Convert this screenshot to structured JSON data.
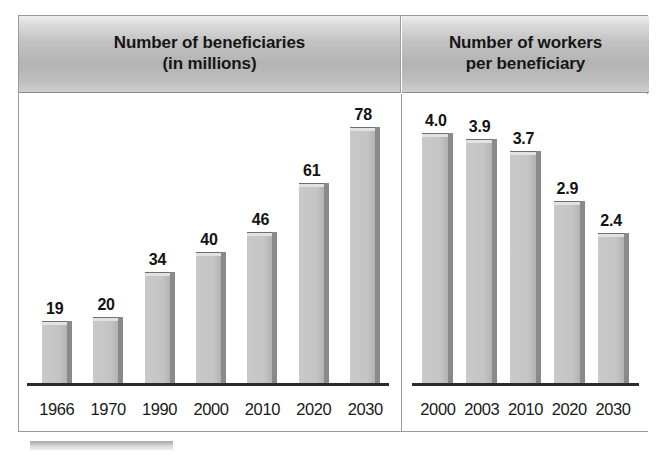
{
  "figure": {
    "panels": [
      {
        "id": "beneficiaries",
        "title": "Number of beneficiaries\n(in millions)"
      },
      {
        "id": "workers-per-beneficiary",
        "title": "Number of workers\nper beneficiary"
      }
    ]
  },
  "colors": {
    "bar_face": "#c4c4c4",
    "bar_top_cap": "#e2e2e2",
    "bar_shadow": "#8a8a8a",
    "header_band": "#b4b4b4",
    "axis": "#2b2b2b",
    "frame_border": "#9a9a9a",
    "text": "#161616",
    "background": "#ffffff"
  },
  "chart_data": [
    {
      "type": "bar",
      "title": "Number of beneficiaries (in millions)",
      "xlabel": "",
      "ylabel": "",
      "ylim": [
        0,
        90
      ],
      "grid": false,
      "legend": "none",
      "categories": [
        "1966",
        "1970",
        "1990",
        "2000",
        "2010",
        "2020",
        "2030"
      ],
      "values": [
        19,
        20,
        34,
        40,
        46,
        61,
        78
      ],
      "value_labels": [
        "19",
        "20",
        "34",
        "40",
        "46",
        "61",
        "78"
      ]
    },
    {
      "type": "bar",
      "title": "Number of workers per beneficiary",
      "xlabel": "",
      "ylabel": "",
      "ylim": [
        0,
        4.6
      ],
      "grid": false,
      "legend": "none",
      "categories": [
        "2000",
        "2003",
        "2010",
        "2020",
        "2030"
      ],
      "values": [
        4.0,
        3.9,
        3.7,
        2.9,
        2.4
      ],
      "value_labels": [
        "4.0",
        "3.9",
        "3.7",
        "2.9",
        "2.4"
      ]
    }
  ]
}
